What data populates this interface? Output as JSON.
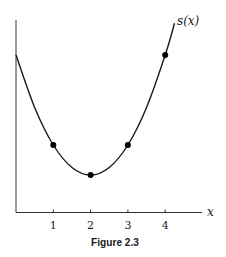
{
  "chart_data": {
    "type": "line",
    "title": "",
    "caption": "Figure 2.3",
    "xlabel": "x",
    "ylabel": "",
    "curve_label": "s(x)",
    "function_description": "smooth convex curve, minimum at x = 2, symmetric about x = 2",
    "xlim": [
      0,
      5
    ],
    "ylim": [
      0,
      6.5
    ],
    "grid": false,
    "x_ticks": [
      1,
      2,
      3,
      4
    ],
    "x_tick_labels": [
      "1",
      "2",
      "3",
      "4"
    ],
    "y_ticks": [],
    "curve_domain": [
      0,
      4.25
    ],
    "series": [
      {
        "name": "s(x)",
        "x": [
          0,
          0.5,
          1,
          1.5,
          2,
          2.5,
          3,
          3.5,
          4,
          4.25
        ],
        "y": [
          5.25,
          3.5,
          2.25,
          1.5,
          1.25,
          1.5,
          2.25,
          3.5,
          5.25,
          6.31
        ]
      }
    ],
    "marked_points": {
      "x": [
        1,
        2,
        3,
        4
      ],
      "y": [
        2.25,
        1.25,
        2.25,
        5.25
      ]
    },
    "colors": {
      "curve": "#1a1a1a",
      "axes": "#333333",
      "points": "#000000"
    }
  }
}
